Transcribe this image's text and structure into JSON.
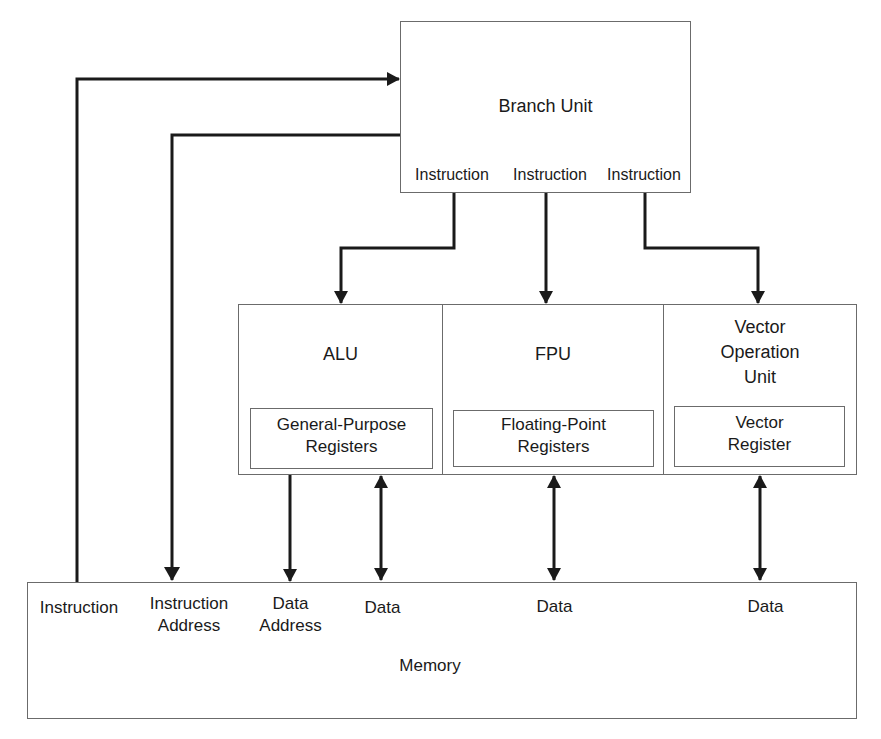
{
  "branch_unit": {
    "title": "Branch Unit",
    "outputs": [
      "Instruction",
      "Instruction",
      "Instruction"
    ]
  },
  "units": [
    {
      "name": "ALU",
      "register": "General-Purpose\nRegisters"
    },
    {
      "name": "FPU",
      "register": "Floating-Point\nRegisters"
    },
    {
      "name": "Vector\nOperation\nUnit",
      "register": "Vector\nRegister"
    }
  ],
  "memory": {
    "title": "Memory",
    "ports": [
      "Instruction",
      "Instruction\nAddress",
      "Data\nAddress",
      "Data",
      "Data",
      "Data"
    ]
  },
  "colors": {
    "line": "#1a1a1a",
    "box_border": "#6b6b6b"
  }
}
